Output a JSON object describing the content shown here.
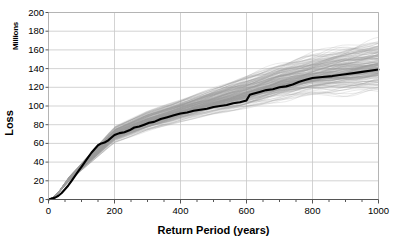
{
  "chart_data": {
    "type": "line",
    "title": "",
    "xlabel": "Return Period (years)",
    "ylabel": "Loss",
    "ylabel_unit": "Millions",
    "xlim": [
      0,
      1000
    ],
    "ylim": [
      0,
      200
    ],
    "xticks": [
      0,
      200,
      400,
      600,
      800,
      1000
    ],
    "yticks": [
      0,
      20,
      40,
      60,
      80,
      100,
      120,
      140,
      160,
      180,
      200
    ],
    "grid": true,
    "legend": "none",
    "colors": {
      "mean_curve": "#000000",
      "simulations": "#9a9a9a",
      "grid": "#c8c8c8",
      "frame": "#b4b4b4",
      "background": "#ffffff"
    },
    "series": [
      {
        "name": "Mean loss exceedance curve",
        "style": "bold-black",
        "x": [
          0,
          10,
          20,
          30,
          40,
          50,
          60,
          70,
          80,
          90,
          100,
          110,
          120,
          130,
          140,
          150,
          160,
          170,
          180,
          190,
          200,
          215,
          230,
          245,
          260,
          275,
          290,
          305,
          320,
          340,
          360,
          380,
          400,
          420,
          440,
          460,
          480,
          500,
          520,
          540,
          560,
          580,
          600,
          610,
          620,
          640,
          660,
          680,
          700,
          720,
          740,
          760,
          780,
          800,
          830,
          860,
          900,
          940,
          1000
        ],
        "y": [
          0,
          1,
          2,
          4,
          7,
          11,
          15,
          20,
          25,
          30,
          35,
          40,
          45,
          50,
          54,
          58,
          60,
          61,
          63,
          66,
          69,
          71,
          72,
          74,
          77,
          78,
          80,
          82,
          83,
          86,
          88,
          90,
          92,
          93,
          95,
          96,
          97,
          99,
          100,
          101,
          103,
          104,
          106,
          112,
          113,
          115,
          117,
          118,
          120,
          121,
          123,
          126,
          128,
          130,
          131,
          132,
          134,
          136,
          139
        ]
      }
    ],
    "simulation_band": {
      "name": "Individual simulation realizations",
      "count": 200,
      "description": "Spaghetti band of stochastic loss realizations fanning out around the mean curve",
      "spread_at_x": [
        {
          "x": 0,
          "lower": 0,
          "upper": 0
        },
        {
          "x": 100,
          "lower": 32,
          "upper": 38
        },
        {
          "x": 200,
          "lower": 63,
          "upper": 76
        },
        {
          "x": 300,
          "lower": 76,
          "upper": 92
        },
        {
          "x": 400,
          "lower": 86,
          "upper": 104
        },
        {
          "x": 500,
          "lower": 94,
          "upper": 116
        },
        {
          "x": 600,
          "lower": 101,
          "upper": 128
        },
        {
          "x": 700,
          "lower": 110,
          "upper": 140
        },
        {
          "x": 800,
          "lower": 116,
          "upper": 150
        },
        {
          "x": 900,
          "lower": 119,
          "upper": 158
        },
        {
          "x": 1000,
          "lower": 122,
          "upper": 164
        }
      ]
    }
  },
  "axes": {
    "y_unit_label": "Millions",
    "y_title": "Loss",
    "x_title": "Return Period (years)",
    "ytick_labels": [
      "200",
      "180",
      "160",
      "140",
      "120",
      "100",
      "80",
      "60",
      "40",
      "20",
      "0"
    ],
    "xtick_labels": [
      "0",
      "200",
      "400",
      "600",
      "800",
      "1000"
    ]
  }
}
